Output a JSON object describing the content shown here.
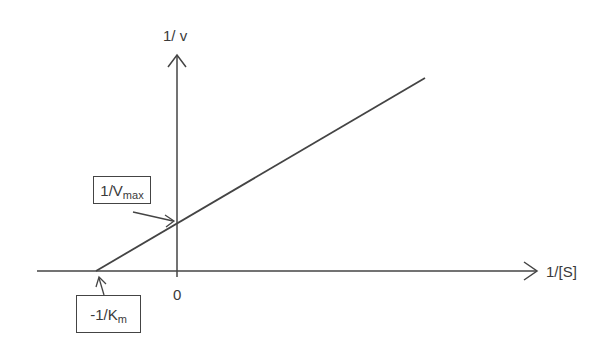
{
  "diagram": {
    "type": "Lineweaver-Burk plot",
    "y_axis_label": "1/ v",
    "x_axis_label": "1/[S]",
    "origin_tick_label": "0",
    "annotations": [
      {
        "id": "y-intercept",
        "text_main": "1/V",
        "text_sub": "max",
        "points_to": "y-intercept of line"
      },
      {
        "id": "x-intercept",
        "text_main": "-1/K",
        "text_sub": "m",
        "points_to": "x-intercept of line"
      }
    ],
    "line": {
      "description": "straight line with positive slope crossing negative x-axis and positive y-axis"
    },
    "colors": {
      "stroke": "#444444",
      "text": "#3a3a3a",
      "background": "#ffffff"
    }
  }
}
